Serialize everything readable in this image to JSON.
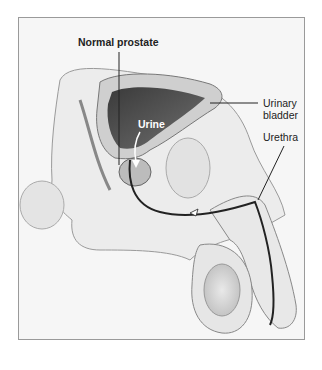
{
  "figure": {
    "labels": {
      "prostate": "Normal prostate",
      "urine": "Urine",
      "bladder_line1": "Urinary",
      "bladder_line2": "bladder",
      "urethra": "Urethra"
    },
    "colors": {
      "frame_border": "#9a9a9a",
      "background": "#f6f6f6",
      "bladder_interior": "#2e2e2e",
      "tissue": "#d9d9d9",
      "line": "#222222"
    }
  }
}
